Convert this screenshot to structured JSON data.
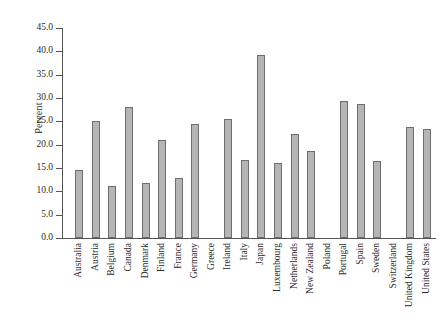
{
  "chart_data": {
    "type": "bar",
    "title": "",
    "subtitle": "",
    "xlabel": "",
    "ylabel": "Percent",
    "ylim": [
      0.0,
      45.0
    ],
    "ytick_step": 5.0,
    "yticks": [
      "0.0",
      "5.0",
      "10.0",
      "15.0",
      "20.0",
      "25.0",
      "30.0",
      "35.0",
      "40.0",
      "45.0"
    ],
    "grid": false,
    "legend": "none",
    "bar_color": "#b5b5b5",
    "bar_edge_color": "#6e6e6e",
    "axis_color": "#555555",
    "background_color": "#ffffff",
    "categories": [
      "Australia",
      "Austria",
      "Belgium",
      "Canada",
      "Denmark",
      "Finland",
      "France",
      "Germany",
      "Greece",
      "Ireland",
      "Italy",
      "Japan",
      "Luxembourg",
      "Netherlands",
      "New Zealand",
      "Poland",
      "Portugal",
      "Spain",
      "Sweden",
      "Switzerland",
      "United Kingdom",
      "United States"
    ],
    "values": [
      14.5,
      25.0,
      11.2,
      28.0,
      11.8,
      21.0,
      12.8,
      24.5,
      null,
      25.4,
      16.8,
      39.3,
      16.1,
      22.2,
      18.6,
      null,
      29.4,
      28.7,
      16.6,
      null,
      23.7,
      23.3
    ]
  }
}
